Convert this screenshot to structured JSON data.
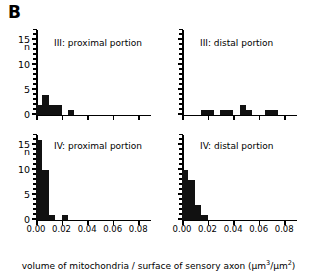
{
  "figure": {
    "panel_letter": "B",
    "caption_prefix": "volume of mitochondria / surface of sensory axon (µm",
    "caption_sup1": "3",
    "caption_mid": "/µm",
    "caption_sup2": "2",
    "caption_suffix": ")",
    "axis_count_label": "n"
  },
  "chart_data": [
    {
      "id": "iii-proximal",
      "type": "bar",
      "title": "III: proximal portion",
      "xlabel": "volume of mitochondria / surface of sensory axon (µm3/µm2)",
      "ylabel": "n",
      "xlim": [
        0.0,
        0.09
      ],
      "ylim": [
        0,
        17
      ],
      "bin_width": 0.005,
      "xticks": [
        0.0,
        0.02,
        0.04,
        0.06,
        0.08
      ],
      "xticklabels": [
        "0.00",
        "0.02",
        "0.04",
        "0.06",
        "0.08"
      ],
      "yticks": [
        0,
        5,
        10,
        15
      ],
      "yticklabels": [
        "0",
        "5",
        "10",
        "15"
      ],
      "y_minor_step": 1,
      "grid": false,
      "legend": "none",
      "bin_starts": [
        0.0,
        0.005,
        0.01,
        0.015,
        0.025
      ],
      "values": [
        2,
        4,
        2,
        2,
        1
      ]
    },
    {
      "id": "iii-distal",
      "type": "bar",
      "title": "III: distal portion",
      "xlabel": "volume of mitochondria / surface of sensory axon (µm3/µm2)",
      "ylabel": "n",
      "xlim": [
        0.0,
        0.09
      ],
      "ylim": [
        0,
        17
      ],
      "bin_width": 0.005,
      "xticks": [
        0.0,
        0.02,
        0.04,
        0.06,
        0.08
      ],
      "xticklabels": [
        "0.00",
        "0.02",
        "0.04",
        "0.06",
        "0.08"
      ],
      "yticks": [
        0,
        5,
        10,
        15
      ],
      "yticklabels": [
        "",
        "",
        "",
        ""
      ],
      "y_minor_step": 1,
      "grid": false,
      "legend": "none",
      "bin_starts": [
        0.015,
        0.02,
        0.03,
        0.035,
        0.045,
        0.05,
        0.065,
        0.07
      ],
      "values": [
        1,
        1,
        1,
        1,
        2,
        1,
        1,
        1
      ]
    },
    {
      "id": "iv-proximal",
      "type": "bar",
      "title": "IV: proximal portion",
      "xlabel": "volume of mitochondria / surface of sensory axon (µm3/µm2)",
      "ylabel": "n",
      "xlim": [
        0.0,
        0.09
      ],
      "ylim": [
        0,
        17
      ],
      "bin_width": 0.005,
      "xticks": [
        0.0,
        0.02,
        0.04,
        0.06,
        0.08
      ],
      "xticklabels": [
        "0.00",
        "0.02",
        "0.04",
        "0.06",
        "0.08"
      ],
      "yticks": [
        0,
        5,
        10,
        15
      ],
      "yticklabels": [
        "0",
        "5",
        "10",
        "15"
      ],
      "y_minor_step": 1,
      "grid": false,
      "legend": "none",
      "bin_starts": [
        0.0,
        0.005,
        0.01,
        0.02
      ],
      "values": [
        16,
        10,
        1,
        1
      ]
    },
    {
      "id": "iv-distal",
      "type": "bar",
      "title": "IV: distal portion",
      "xlabel": "volume of mitochondria / surface of sensory axon (µm3/µm2)",
      "ylabel": "n",
      "xlim": [
        0.0,
        0.09
      ],
      "ylim": [
        0,
        17
      ],
      "bin_width": 0.005,
      "xticks": [
        0.0,
        0.02,
        0.04,
        0.06,
        0.08
      ],
      "xticklabels": [
        "0.00",
        "0.02",
        "0.04",
        "0.06",
        "0.08"
      ],
      "yticks": [
        0,
        5,
        10,
        15
      ],
      "yticklabels": [
        "",
        "",
        "",
        ""
      ],
      "y_minor_step": 1,
      "grid": false,
      "legend": "none",
      "bin_starts": [
        0.0,
        0.005,
        0.01,
        0.015
      ],
      "values": [
        10,
        8,
        3,
        1
      ]
    }
  ],
  "colors": {
    "bar": "#111111",
    "axis": "#000000",
    "background": "#ffffff",
    "text": "#000000"
  }
}
